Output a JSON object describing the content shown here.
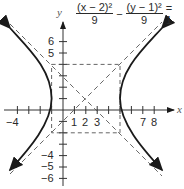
{
  "figure": {
    "equation": {
      "term1_num": "(x − 2)²",
      "term1_den": "9",
      "minus": "−",
      "term2_num": "(y − 1)²",
      "term2_den": "9",
      "rhs": "= 1"
    },
    "axes": {
      "x_label": "x",
      "y_label": "y",
      "x_tick_labels": [
        {
          "value": -4,
          "text": "−4"
        },
        {
          "value": 1,
          "text": "1"
        },
        {
          "value": 2,
          "text": "2"
        },
        {
          "value": 3,
          "text": "3"
        },
        {
          "value": 7,
          "text": "7"
        },
        {
          "value": 8,
          "text": "8"
        }
      ],
      "y_tick_labels": [
        {
          "value": 6,
          "text": "6"
        },
        {
          "value": 5,
          "text": "5"
        },
        {
          "value": -4,
          "text": "−4"
        },
        {
          "value": -5,
          "text": "−5"
        },
        {
          "value": -6,
          "text": "−6"
        }
      ]
    },
    "hyperbola": {
      "center": [
        2,
        1
      ],
      "a": 3,
      "b": 3,
      "orientation": "horizontal",
      "vertices": [
        [
          -1,
          1
        ],
        [
          5,
          1
        ]
      ],
      "asymptotes": [
        "y − 1 = x − 2",
        "y − 1 = −(x − 2)"
      ],
      "fundamental_rectangle": {
        "x_min": -1,
        "x_max": 5,
        "y_min": -2,
        "y_max": 4
      }
    },
    "colors": {
      "curve": "#1a1a1a",
      "axes": "#333333",
      "dashed": "#555555",
      "text": "#2a2a2a"
    }
  }
}
